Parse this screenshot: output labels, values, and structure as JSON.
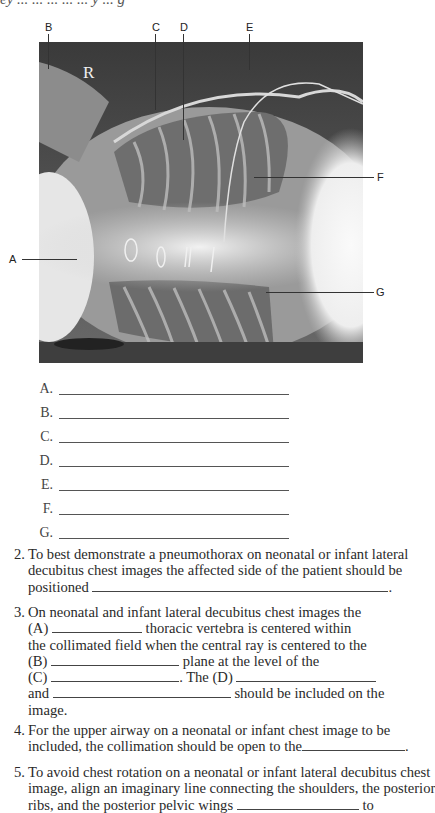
{
  "header_cut_text": "ey   ...           ...   ...      ...  ...  y ... g",
  "figure": {
    "marker": "R",
    "labels": [
      {
        "id": "A",
        "text": "A"
      },
      {
        "id": "B",
        "text": "B"
      },
      {
        "id": "C",
        "text": "C"
      },
      {
        "id": "D",
        "text": "D"
      },
      {
        "id": "E",
        "text": "E"
      },
      {
        "id": "F",
        "text": "F"
      },
      {
        "id": "G",
        "text": "G"
      }
    ]
  },
  "answers": [
    {
      "letter": "A.",
      "value": ""
    },
    {
      "letter": "B.",
      "value": ""
    },
    {
      "letter": "C.",
      "value": ""
    },
    {
      "letter": "D.",
      "value": ""
    },
    {
      "letter": "E.",
      "value": ""
    },
    {
      "letter": "F.",
      "value": ""
    },
    {
      "letter": "G.",
      "value": ""
    }
  ],
  "questions": [
    {
      "number": "2.",
      "lines": [
        "To best demonstrate a pneumothorax on neonatal or infant lateral",
        "decubitus chest images the affected side of the patient should be",
        "positioned"
      ],
      "line3_end": "."
    },
    {
      "number": "3.",
      "line1": "On neonatal and infant lateral decubitus chest images the",
      "line2_prefix": "(A)",
      "line2_suffix": "thoracic vertebra is centered within",
      "line3": "the collimated field when the central ray is centered to the",
      "line4_prefix": "(B)",
      "line4_suffix": "plane at the level of the",
      "line5_prefix": "(C)",
      "line5_mid": ". The (D)",
      "line6_prefix": "and",
      "line6_suffix": "should be included on the",
      "line7": "image."
    },
    {
      "number": "4.",
      "line1": "For the upper airway on a neonatal or infant chest image to be",
      "line2": "included, the collimation should be open to the",
      "line2_end": "."
    },
    {
      "number": "5.",
      "line1": "To avoid chest rotation on a neonatal or infant lateral decubitus chest",
      "line2": "image, align an imaginary line connecting the shoulders, the posterior",
      "line3_prefix": "ribs, and the posterior pelvic wings",
      "line3_suffix": "to"
    }
  ]
}
